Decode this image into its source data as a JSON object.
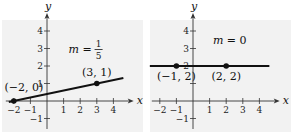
{
  "chart_data": [
    {
      "type": "line",
      "title": "",
      "annotation": {
        "slope_label": "m =",
        "slope_num": "1",
        "slope_den": "5"
      },
      "xlabel": "x",
      "ylabel": "y",
      "xlim": [
        -2.3,
        4.5
      ],
      "ylim": [
        -1.6,
        4.8
      ],
      "xticks": [
        -2,
        -1,
        1,
        2,
        3,
        4
      ],
      "yticks": [
        -1,
        1,
        2,
        3,
        4
      ],
      "grid": false,
      "background": "#f2f2f2",
      "line": {
        "x": [
          -2.3,
          4.6
        ],
        "y": [
          -0.06,
          1.32
        ],
        "color": "#111111"
      },
      "points": [
        {
          "x": -2,
          "y": 0,
          "label": "(−2, 0)"
        },
        {
          "x": 3,
          "y": 1,
          "label": "(3, 1)"
        }
      ]
    },
    {
      "type": "line",
      "title": "",
      "annotation": {
        "slope_label": "m = 0"
      },
      "xlabel": "x",
      "ylabel": "y",
      "xlim": [
        -2.3,
        4.5
      ],
      "ylim": [
        -1.6,
        4.8
      ],
      "xticks": [
        -2,
        -1,
        1,
        2,
        3,
        4
      ],
      "yticks": [
        -1,
        1,
        2,
        3,
        4
      ],
      "grid": false,
      "background": "#f2f2f2",
      "line": {
        "x": [
          -2.6,
          4.6
        ],
        "y": [
          2,
          2
        ],
        "color": "#111111"
      },
      "points": [
        {
          "x": -1,
          "y": 2,
          "label": "(−1, 2)"
        },
        {
          "x": 2,
          "y": 2,
          "label": "(2, 2)"
        }
      ]
    }
  ]
}
